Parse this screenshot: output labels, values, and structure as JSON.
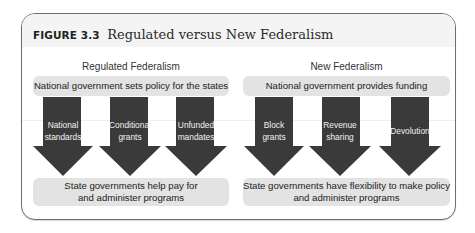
{
  "figure": {
    "label": "FIGURE 3.3",
    "title": "Regulated versus New Federalism"
  },
  "left": {
    "heading": "Regulated Federalism",
    "top_box": "National government sets policy for the states",
    "arrows": [
      {
        "line1": "National",
        "line2": "standards"
      },
      {
        "line1": "Conditional",
        "line2": "grants"
      },
      {
        "line1": "Unfunded",
        "line2": "mandates"
      }
    ],
    "bottom_box": {
      "line1": "State governments help pay for",
      "line2": "and administer programs"
    }
  },
  "right": {
    "heading": "New Federalism",
    "top_box": "National government provides funding",
    "arrows": [
      {
        "line1": "Block",
        "line2": "grants"
      },
      {
        "line1": "Revenue",
        "line2": "sharing"
      },
      {
        "line1": "Devolution",
        "line2": ""
      }
    ],
    "bottom_box": {
      "line1": "State governments have flexibility to make policy",
      "line2": "and administer programs"
    }
  },
  "colors": {
    "arrow_fill": "#3a3a3a",
    "box_fill": "#e3e3e3",
    "frame_border": "#6e6e6e",
    "title_band": "#f4f4f4"
  }
}
